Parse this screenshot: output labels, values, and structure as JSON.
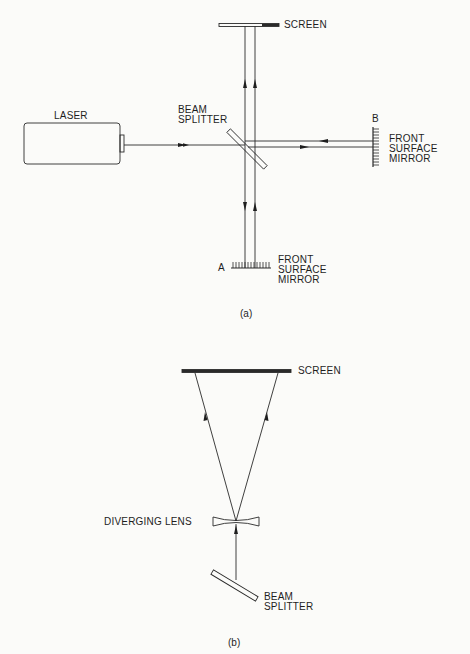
{
  "figure_a": {
    "caption": "(a)",
    "laser": {
      "label": "LASER"
    },
    "screen": {
      "label": "SCREEN"
    },
    "beam_splitter": {
      "line1": "BEAM",
      "line2": "SPLITTER"
    },
    "mirror_a": {
      "letter": "A",
      "line1": "FRONT",
      "line2": "SURFACE",
      "line3": "MIRROR"
    },
    "mirror_b": {
      "letter": "B",
      "line1": "FRONT",
      "line2": "SURFACE",
      "line3": "MIRROR"
    }
  },
  "figure_b": {
    "caption": "(b)",
    "screen": {
      "label": "SCREEN"
    },
    "lens": {
      "label": "DIVERGING LENS"
    },
    "beam_splitter": {
      "line1": "BEAM",
      "line2": "SPLITTER"
    }
  },
  "colors": {
    "ink": "#1e1e1e",
    "background": "#fbfbf9"
  }
}
